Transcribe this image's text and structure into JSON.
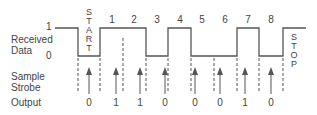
{
  "labels": {
    "received_data_line1": "Received",
    "received_data_line2": "Data",
    "sample_strobe_line1": "Sample",
    "sample_strobe_line2": "Strobe",
    "output": "Output",
    "level_high": "1",
    "level_low": "0"
  },
  "start_label": [
    "S",
    "T",
    "A",
    "R",
    "T"
  ],
  "stop_label": [
    "S",
    "T",
    "O",
    "P"
  ],
  "bit_labels": [
    "1",
    "2",
    "3",
    "4",
    "5",
    "6",
    "7",
    "8"
  ],
  "outputs": [
    "0",
    "1",
    "1",
    "0",
    "0",
    "0",
    "1",
    "0"
  ],
  "waveform": {
    "levels_sequence": [
      "idle-high",
      "start-low",
      "1",
      "1",
      "0",
      "1",
      "0",
      "0",
      "1",
      "0",
      "stop-high"
    ]
  },
  "colors": {
    "line": "#555555",
    "text": "#444444"
  }
}
